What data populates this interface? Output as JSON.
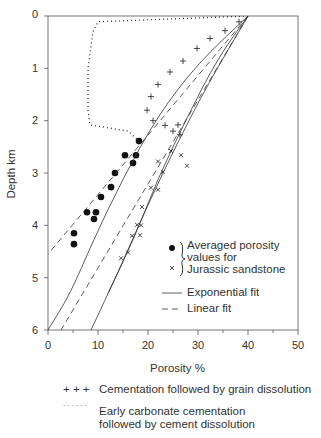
{
  "chart_data": {
    "type": "scatter",
    "title": "",
    "xlabel": "Porosity %",
    "ylabel": "Depth km",
    "xlim": [
      0,
      50
    ],
    "ylim": [
      6,
      0
    ],
    "x_ticks": [
      0,
      10,
      20,
      30,
      40,
      50
    ],
    "y_ticks": [
      0,
      1,
      2,
      3,
      4,
      5,
      6
    ],
    "grid": false,
    "series": [
      {
        "name": "Averaged porosity values for Jurassic sandstone (dots)",
        "marker": "dot",
        "points": [
          [
            18.2,
            2.39
          ],
          [
            15.4,
            2.66
          ],
          [
            17.6,
            2.66
          ],
          [
            17.0,
            2.81
          ],
          [
            13.4,
            3.0
          ],
          [
            12.6,
            3.27
          ],
          [
            10.6,
            3.46
          ],
          [
            7.8,
            3.75
          ],
          [
            9.6,
            3.75
          ],
          [
            9.2,
            3.88
          ],
          [
            5.2,
            4.15
          ],
          [
            5.2,
            4.36
          ]
        ]
      },
      {
        "name": "Averaged porosity values for Jurassic sandstone (crosses)",
        "marker": "x",
        "points": [
          [
            24.6,
            2.58
          ],
          [
            22.0,
            2.78
          ],
          [
            26.6,
            2.66
          ],
          [
            23.0,
            2.98
          ],
          [
            27.8,
            2.86
          ],
          [
            20.6,
            3.28
          ],
          [
            22.0,
            3.32
          ],
          [
            18.8,
            3.65
          ],
          [
            17.8,
            3.99
          ],
          [
            18.6,
            4.0
          ],
          [
            16.8,
            4.2
          ],
          [
            18.4,
            4.19
          ],
          [
            16.0,
            4.52
          ],
          [
            14.6,
            4.63
          ]
        ]
      },
      {
        "name": "Cementation followed by grain dissolution",
        "marker": "+",
        "points": [
          [
            38.2,
            0.11
          ],
          [
            35.4,
            0.28
          ],
          [
            32.4,
            0.43
          ],
          [
            29.8,
            0.62
          ],
          [
            27.0,
            0.86
          ],
          [
            24.4,
            1.07
          ],
          [
            22.0,
            1.31
          ],
          [
            20.6,
            1.54
          ],
          [
            19.8,
            1.8
          ],
          [
            21.0,
            2.0
          ],
          [
            23.4,
            2.09
          ],
          [
            26.0,
            2.08
          ],
          [
            25.0,
            2.2
          ],
          [
            26.4,
            2.27
          ]
        ]
      },
      {
        "name": "Early carbonate cementation followed by cement dissolution",
        "style": "dotted",
        "points": [
          [
            40.0,
            0.0
          ],
          [
            10.0,
            0.11
          ],
          [
            9.0,
            0.3
          ],
          [
            8.0,
            1.0
          ],
          [
            8.0,
            1.8
          ],
          [
            8.4,
            2.08
          ],
          [
            11.0,
            2.12
          ],
          [
            16.0,
            2.2
          ],
          [
            18.2,
            2.39
          ]
        ]
      },
      {
        "name": "Exponential fit (upper, dots)",
        "style": "solid",
        "points": [
          [
            40,
            0
          ],
          [
            30,
            0.9
          ],
          [
            22,
            1.9
          ],
          [
            15,
            3.1
          ],
          [
            9,
            4.3
          ],
          [
            4.5,
            5.3
          ],
          [
            0,
            6.0
          ]
        ]
      },
      {
        "name": "Linear fit (upper, dots)",
        "style": "dashed",
        "points": [
          [
            40,
            0
          ],
          [
            0,
            4.55
          ]
        ]
      },
      {
        "name": "Exponential fit (lower, crosses)",
        "style": "solid",
        "points": [
          [
            40,
            0
          ],
          [
            32,
            1.3
          ],
          [
            26,
            2.4
          ],
          [
            20,
            3.6
          ],
          [
            14,
            4.9
          ],
          [
            8.6,
            6.0
          ]
        ]
      },
      {
        "name": "Linear fit (lower, crosses)",
        "style": "dashed",
        "points": [
          [
            40,
            0
          ],
          [
            2.6,
            6.0
          ]
        ]
      },
      {
        "name": "Exponential fit (middle)",
        "style": "solid",
        "points": [
          [
            40,
            0
          ],
          [
            34,
            0.8
          ],
          [
            28,
            1.9
          ],
          [
            22,
            3.1
          ],
          [
            17,
            4.3
          ],
          [
            12,
            5.3
          ]
        ]
      }
    ],
    "legend": {
      "position": "inside lower right",
      "entries": [
        {
          "symbol": "dot",
          "label": "Averaged porosity values for Jurassic sandstone"
        },
        {
          "symbol": "x",
          "label": "Averaged porosity values for Jurassic sandstone"
        },
        {
          "symbol": "solid-line",
          "label": "Exponential fit"
        },
        {
          "symbol": "dashed-line",
          "label": "Linear fit"
        }
      ]
    },
    "annotations": [
      {
        "symbol": "+ + +",
        "label": "Cementation followed by grain dissolution"
      },
      {
        "symbol": "......",
        "label": "Early carbonate cementation followed by cement dissolution"
      }
    ]
  },
  "axes": {
    "xlabel": "Porosity %",
    "ylabel": "Depth km",
    "x_ticks": [
      "0",
      "10",
      "20",
      "30",
      "40",
      "50"
    ],
    "y_ticks": [
      "0",
      "1",
      "2",
      "3",
      "4",
      "5",
      "6"
    ]
  },
  "legend": {
    "line1": "Averaged porosity",
    "line2": "values for",
    "line3": "Jurassic sandstone",
    "exp": "Exponential fit",
    "lin": "Linear fit"
  },
  "notes": {
    "plus_symbol": "+ + +",
    "plus_label": "Cementation followed by grain dissolution",
    "dot_symbol": "· · · · · ·",
    "dot_label_1": "Early carbonate cementation",
    "dot_label_2": "followed by cement dissolution"
  }
}
